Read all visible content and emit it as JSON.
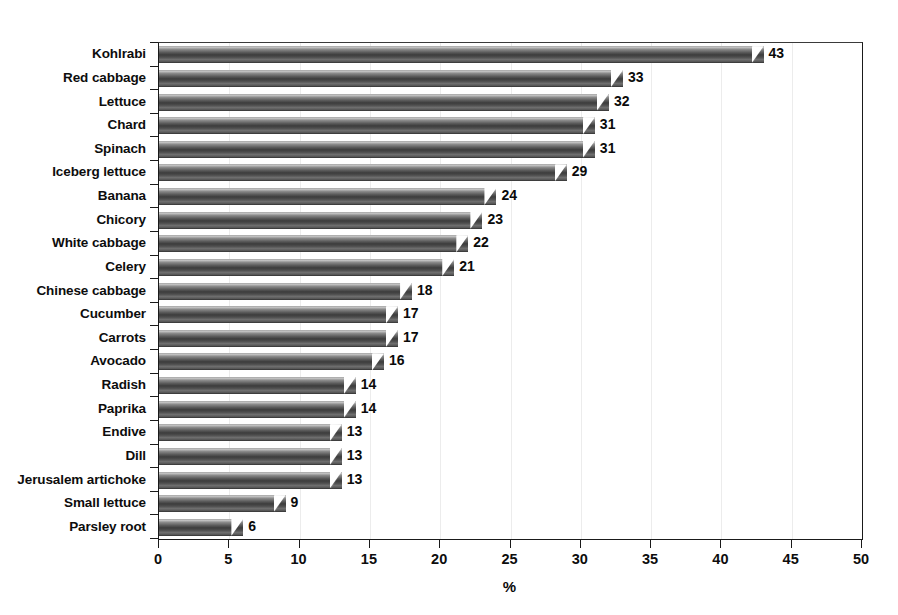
{
  "chart_data": {
    "type": "bar",
    "orientation": "horizontal",
    "title": "",
    "subtitle": "",
    "xlabel": "%",
    "ylabel": "",
    "xlim": [
      0,
      50
    ],
    "xticks": [
      0,
      5,
      10,
      15,
      20,
      25,
      30,
      35,
      40,
      45,
      50
    ],
    "xtick_labels": [
      "0",
      "5",
      "10",
      "15",
      "20",
      "25",
      "30",
      "35",
      "40",
      "45",
      "50"
    ],
    "grid": "vertical-light",
    "legend": null,
    "legend_position": "none",
    "data_labels": true,
    "categories": [
      "Kohlrabi",
      "Red cabbage",
      "Lettuce",
      "Chard",
      "Spinach",
      "Iceberg lettuce",
      "Banana",
      "Chicory",
      "White cabbage",
      "Celery",
      "Chinese cabbage",
      "Cucumber",
      "Carrots",
      "Avocado",
      "Radish",
      "Paprika",
      "Endive",
      "Dill",
      "Jerusalem artichoke",
      "Small lettuce",
      "Parsley root"
    ],
    "values": [
      43,
      33,
      32,
      31,
      31,
      29,
      24,
      23,
      22,
      21,
      18,
      17,
      17,
      16,
      14,
      14,
      13,
      13,
      13,
      9,
      6
    ],
    "value_labels": [
      "43",
      "33",
      "32",
      "31",
      "31",
      "29",
      "24",
      "23",
      "22",
      "21",
      "18",
      "17",
      "17",
      "16",
      "14",
      "14",
      "13",
      "13",
      "13",
      "9",
      "6"
    ],
    "series": [
      {
        "name": "",
        "values": [
          43,
          33,
          32,
          31,
          31,
          29,
          24,
          23,
          22,
          21,
          18,
          17,
          17,
          16,
          14,
          14,
          13,
          13,
          13,
          9,
          6
        ]
      }
    ]
  },
  "colors": {
    "bar_fill_dark": "#3c3c3c",
    "bar_fill_mid": "#6f6f6f",
    "bar_fill_light": "#c8c8c8",
    "axis_line": "#1a1a1a",
    "gridline": "#ececec",
    "text": "#0d0d0d",
    "background": "#ffffff"
  }
}
